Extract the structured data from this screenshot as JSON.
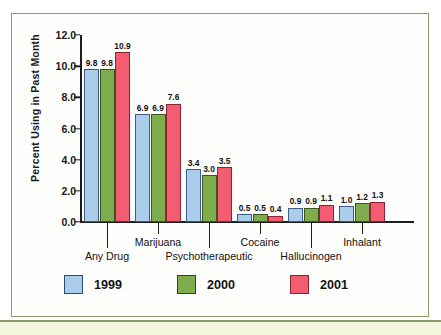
{
  "chart_data": {
    "type": "bar",
    "title": "",
    "subtitle": "",
    "xlabel": "",
    "ylabel": "Percent Using in Past Month",
    "ylim": [
      0,
      12
    ],
    "yticks": [
      "0.0",
      "2.0",
      "4.0",
      "6.0",
      "8.0",
      "10.0",
      "12.0"
    ],
    "grid": false,
    "legend_position": "bottom",
    "categories": [
      "Any Drug",
      "Marijuana",
      "Psychotherapeutic",
      "Cocaine",
      "Hallucinogen",
      "Inhalant"
    ],
    "series": [
      {
        "name": "1999",
        "color": "#a9cdeb",
        "values": [
          9.8,
          6.9,
          3.4,
          0.5,
          0.9,
          1.0
        ],
        "labels": [
          "9.8",
          "6.9",
          "3.4",
          "0.5",
          "0.9",
          "1.0"
        ]
      },
      {
        "name": "2000",
        "color": "#7fad4e",
        "values": [
          9.8,
          6.9,
          3.0,
          0.5,
          0.9,
          1.2
        ],
        "labels": [
          "9.8",
          "6.9",
          "3.0",
          "0.5",
          "0.9",
          "1.2"
        ]
      },
      {
        "name": "2001",
        "color": "#f25d72",
        "values": [
          10.9,
          7.6,
          3.5,
          0.4,
          1.1,
          1.3
        ],
        "labels": [
          "10.9",
          "7.6",
          "3.5",
          "0.4",
          "1.1",
          "1.3"
        ]
      }
    ]
  },
  "legend": {
    "items": [
      {
        "label": "1999",
        "key": "y1999"
      },
      {
        "label": "2000",
        "key": "y2000"
      },
      {
        "label": "2001",
        "key": "y2001"
      }
    ]
  },
  "axis": {
    "y_title": "Percent Using in Past Month",
    "y_ticks": [
      "12.0",
      "10.0",
      "8.0",
      "6.0",
      "4.0",
      "2.0",
      "0.0"
    ],
    "x_categories_top": [
      "Marijuana",
      "Cocaine",
      "Inhalant"
    ],
    "x_categories_bottom": [
      "Any Drug",
      "Psychotherapeutic",
      "Hallucinogen"
    ]
  }
}
